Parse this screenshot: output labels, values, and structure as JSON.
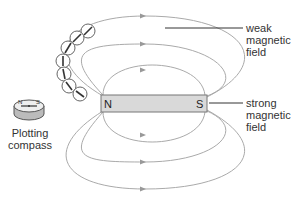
{
  "diagram": {
    "magnet": {
      "north_label": "N",
      "south_label": "S",
      "fill": "#d9d9d9",
      "stroke": "#777777"
    },
    "field_line_color": "#aaaaaa",
    "labels": {
      "weak": [
        "weak",
        "magnetic",
        "field"
      ],
      "strong": [
        "strong",
        "magnetic",
        "field"
      ],
      "compass": [
        "Plotting",
        "compass"
      ]
    },
    "compass_icon": {
      "north": "N",
      "south": "S"
    },
    "chain_compass_count": 8
  }
}
